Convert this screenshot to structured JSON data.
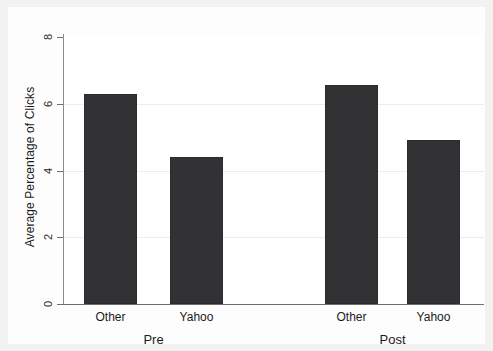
{
  "chart_data": {
    "type": "bar",
    "title": "",
    "subtitle": "",
    "xlabel": "",
    "ylabel": "Average Percentage of Clicks",
    "ylim": [
      0,
      8
    ],
    "y_ticks": [
      0,
      2,
      4,
      6,
      8
    ],
    "y_tick_labels": [
      "0",
      "2",
      "4",
      "6",
      "8"
    ],
    "grid": "horizontal",
    "legend": "none",
    "group_labels": [
      "Pre",
      "Post"
    ],
    "categories": [
      "Other",
      "Yahoo",
      "Other",
      "Yahoo"
    ],
    "values": [
      6.3,
      4.4,
      6.55,
      4.9
    ],
    "bar_color": "#323234",
    "bars": [
      {
        "group": "Pre",
        "category": "Other",
        "value": 6.3
      },
      {
        "group": "Pre",
        "category": "Yahoo",
        "value": 4.4
      },
      {
        "group": "Post",
        "category": "Other",
        "value": 6.55
      },
      {
        "group": "Post",
        "category": "Yahoo",
        "value": 4.9
      }
    ]
  },
  "figure": {
    "background_color": "#f2f2f2",
    "plot_background_color": "#ffffff",
    "axis_color": "#6f6f71",
    "gridline_color": "#ececed"
  }
}
